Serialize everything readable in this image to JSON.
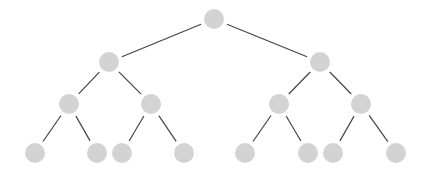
{
  "diagram": {
    "type": "binary-tree",
    "depth": 4,
    "colors": {
      "node_fill": "#d3d3d3",
      "edge_stroke": "#444444",
      "background": "#ffffff"
    },
    "node_radius": 10,
    "nodes": [
      {
        "id": "n0",
        "level": 0,
        "x": 214,
        "y": 19
      },
      {
        "id": "n1",
        "level": 1,
        "x": 109,
        "y": 62
      },
      {
        "id": "n2",
        "level": 1,
        "x": 320,
        "y": 62
      },
      {
        "id": "n3",
        "level": 2,
        "x": 69,
        "y": 104
      },
      {
        "id": "n4",
        "level": 2,
        "x": 151,
        "y": 104
      },
      {
        "id": "n5",
        "level": 2,
        "x": 279,
        "y": 104
      },
      {
        "id": "n6",
        "level": 2,
        "x": 361,
        "y": 104
      },
      {
        "id": "n7",
        "level": 3,
        "x": 35,
        "y": 153
      },
      {
        "id": "n8",
        "level": 3,
        "x": 97,
        "y": 153
      },
      {
        "id": "n9",
        "level": 3,
        "x": 122,
        "y": 153
      },
      {
        "id": "n10",
        "level": 3,
        "x": 184,
        "y": 153
      },
      {
        "id": "n11",
        "level": 3,
        "x": 245,
        "y": 153
      },
      {
        "id": "n12",
        "level": 3,
        "x": 308,
        "y": 153
      },
      {
        "id": "n13",
        "level": 3,
        "x": 333,
        "y": 153
      },
      {
        "id": "n14",
        "level": 3,
        "x": 396,
        "y": 153
      }
    ],
    "edges": [
      [
        "n0",
        "n1"
      ],
      [
        "n0",
        "n2"
      ],
      [
        "n1",
        "n3"
      ],
      [
        "n1",
        "n4"
      ],
      [
        "n2",
        "n5"
      ],
      [
        "n2",
        "n6"
      ],
      [
        "n3",
        "n7"
      ],
      [
        "n3",
        "n8"
      ],
      [
        "n4",
        "n9"
      ],
      [
        "n4",
        "n10"
      ],
      [
        "n5",
        "n11"
      ],
      [
        "n5",
        "n12"
      ],
      [
        "n6",
        "n13"
      ],
      [
        "n6",
        "n14"
      ]
    ]
  }
}
